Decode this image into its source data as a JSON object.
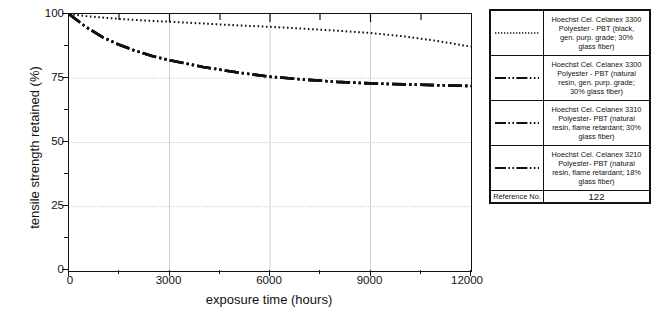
{
  "chart_data": {
    "type": "line",
    "title": "",
    "xlabel": "exposure time (hours)",
    "ylabel": "tensile strength retained (%)",
    "xlim": [
      0,
      12000
    ],
    "ylim": [
      0,
      100
    ],
    "xticks": [
      0,
      3000,
      6000,
      9000,
      12000
    ],
    "xtick_labels": [
      "0",
      "3000",
      "6000",
      "9000",
      "12000"
    ],
    "yticks": [
      0,
      25,
      50,
      75,
      100
    ],
    "ytick_labels": [
      "0",
      "25",
      "50",
      "75",
      "100"
    ],
    "grid": true,
    "grid_axis": "y",
    "legend_position": "right-outside",
    "series": [
      {
        "name": "Hoechst Cel. Celanex 3300 Polyester - PBT (black, gen. purp. grade; 30% glass fiber)",
        "style": "dotted",
        "x": [
          0,
          500,
          1000,
          1500,
          2000,
          2500,
          3000,
          4000,
          5000,
          6000,
          7000,
          8000,
          9000,
          10000,
          11000,
          12000
        ],
        "y": [
          100,
          99.2,
          98.6,
          98.1,
          97.7,
          97.3,
          97.0,
          96.3,
          95.6,
          95.0,
          94.3,
          93.5,
          92.6,
          91.3,
          89.5,
          87.3
        ]
      },
      {
        "name": "Hoechst Cel. Celanex 3300 Polyester - PBT (natural resin, gen. purp. grade; 30% glass fiber)",
        "style": "dash-dot-dot",
        "x": [
          0,
          500,
          1000,
          1500,
          2000,
          2500,
          3000,
          4000,
          5000,
          6000,
          7000,
          8000,
          9000,
          10000,
          11000,
          12000
        ],
        "y": [
          100,
          95.0,
          91.0,
          88.0,
          85.6,
          83.6,
          82.0,
          79.4,
          77.3,
          75.6,
          74.5,
          73.6,
          73.0,
          72.6,
          72.3,
          72.0
        ]
      },
      {
        "name": "Hoechst Cel. Celanex 3310 Polyester - PBT (natural resin, flame retardant; 30% glass fiber)",
        "style": "dash-dot-dot",
        "x": [
          0,
          500,
          1000,
          1500,
          2000,
          2500,
          3000,
          4000,
          5000,
          6000,
          7000,
          8000,
          9000,
          10000,
          11000,
          12000
        ],
        "y": [
          100,
          95.0,
          91.0,
          88.0,
          85.6,
          83.6,
          82.0,
          79.4,
          77.3,
          75.6,
          74.5,
          73.6,
          73.0,
          72.6,
          72.3,
          72.0
        ]
      },
      {
        "name": "Hoechst Cel. Celanex 3210 Polyester - PBT (natural resin, flame retardant; 18% glass fiber)",
        "style": "dash-dot-dot",
        "x": [
          0,
          500,
          1000,
          1500,
          2000,
          2500,
          3000,
          4000,
          5000,
          6000,
          7000,
          8000,
          9000,
          10000,
          11000,
          12000
        ],
        "y": [
          100,
          95.0,
          91.0,
          88.0,
          85.6,
          83.6,
          82.0,
          79.4,
          77.3,
          75.6,
          74.5,
          73.6,
          73.0,
          72.6,
          72.3,
          72.0
        ]
      }
    ]
  },
  "axes": {
    "y_title": "tensile strength retained (%)",
    "x_title": "exposure time (hours)",
    "y_labels": [
      "100",
      "75",
      "50",
      "25",
      "0"
    ],
    "x_labels": [
      "0",
      "3000",
      "6000",
      "9000",
      "12000"
    ]
  },
  "legend": {
    "rows": [
      {
        "style": "dotted",
        "line1": "Hoechst Cel. Celanex 3300",
        "line2": "Polyester - PBT (black,",
        "line3": "gen. purp. grade; 30%",
        "line4": "glass fiber)"
      },
      {
        "style": "dash-dot-dot",
        "line1": "Hoechst Cel. Celanex 3300",
        "line2": "Polyester - PBT (natural",
        "line3": "resin, gen. purp. grade;",
        "line4": "30% glass fiber)"
      },
      {
        "style": "dash-dot-dot",
        "line1": "Hoechst Cel. Celanex 3310",
        "line2": "Polyester- PBT (natural",
        "line3": "resin, flame retardant; 30%",
        "line4": "glass fiber)"
      },
      {
        "style": "dash-dot-dot",
        "line1": "Hoechst Cel. Celanex 3210",
        "line2": "Polyester- PBT (natural",
        "line3": "resin, flame retardant; 18%",
        "line4": "glass fiber)"
      }
    ],
    "reference_label": "Reference No.",
    "reference_value": "122"
  },
  "colors": {
    "line": "#111111",
    "grid": "#b8b8b8",
    "axis": "#111111",
    "background": "#ffffff"
  }
}
